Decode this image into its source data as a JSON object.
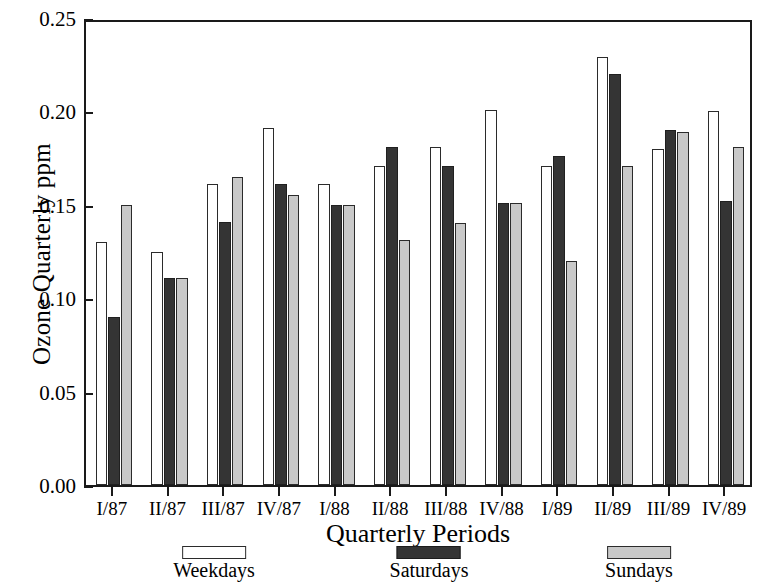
{
  "chart_data": {
    "type": "bar",
    "title": "",
    "xlabel": "Quarterly Periods",
    "ylabel": "Ozone Quarterly ppm",
    "categories": [
      "I/87",
      "II/87",
      "III/87",
      "IV/87",
      "I/88",
      "II/88",
      "III/88",
      "IV/88",
      "I/89",
      "II/89",
      "III/89",
      "IV/89"
    ],
    "series": [
      {
        "name": "Weekdays",
        "color": "#ffffff",
        "values": [
          0.13,
          0.125,
          0.161,
          0.191,
          0.161,
          0.171,
          0.181,
          0.201,
          0.171,
          0.229,
          0.18,
          0.2
        ]
      },
      {
        "name": "Saturdays",
        "color": "#343434",
        "values": [
          0.09,
          0.111,
          0.141,
          0.161,
          0.15,
          0.181,
          0.171,
          0.151,
          0.176,
          0.22,
          0.19,
          0.152
        ]
      },
      {
        "name": "Sundays",
        "color": "#c9c9c9",
        "values": [
          0.15,
          0.111,
          0.165,
          0.155,
          0.15,
          0.131,
          0.14,
          0.151,
          0.12,
          0.171,
          0.189,
          0.181
        ]
      }
    ],
    "ylim": [
      0.0,
      0.25
    ],
    "ytick_labels": [
      "0.00",
      "0.05",
      "0.10",
      "0.15",
      "0.20",
      "0.25"
    ],
    "ytick_values": [
      0.0,
      0.05,
      0.1,
      0.15,
      0.2,
      0.25
    ],
    "grid": false,
    "legend_position": "bottom",
    "legend_entries": [
      "Weekdays",
      "Saturdays",
      "Sundays"
    ]
  }
}
